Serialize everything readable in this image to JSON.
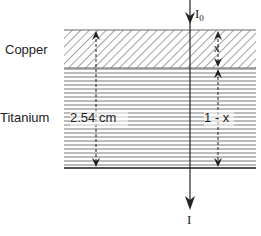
{
  "diagram": {
    "layers": [
      {
        "name": "Copper",
        "pattern": "diagonal-hatch",
        "thickness_label": "x"
      },
      {
        "name": "Titanium",
        "pattern": "horizontal-lines",
        "thickness_label": "1 - x"
      }
    ],
    "total_thickness_label": "2.54 cm",
    "beam": {
      "incident_label": "I",
      "incident_subscript": "0",
      "transmitted_label": "I"
    },
    "colors": {
      "line": "#222222",
      "hatch": "#555555",
      "background": "#ffffff"
    }
  }
}
